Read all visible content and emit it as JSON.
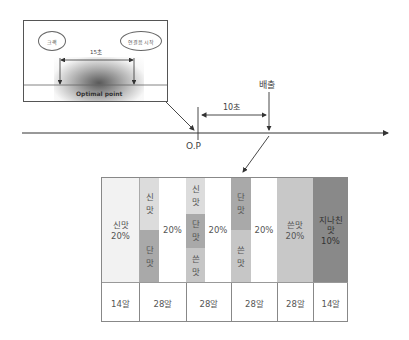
{
  "inset": {
    "left_oval": "크랙",
    "right_oval": "연결음 시작",
    "interval": "15초",
    "caption": "Optimal point"
  },
  "timeline": {
    "op_label": "O.P",
    "interval": "10초",
    "release_label": "배출"
  },
  "table": {
    "columns": [
      {
        "main": "신맛\n20%",
        "strips": [],
        "count": "14알"
      },
      {
        "main": "20%",
        "strips": [
          {
            "text": "신\n맛"
          },
          {
            "text": "단\n맛"
          }
        ],
        "count": "28알"
      },
      {
        "main": "20%",
        "strips": [
          {
            "text": "신\n맛"
          },
          {
            "text": "단\n맛"
          },
          {
            "text": "쓴\n맛"
          }
        ],
        "count": "28알"
      },
      {
        "main": "20%",
        "strips": [
          {
            "text": "단\n맛"
          },
          {
            "text": "쓴\n맛"
          }
        ],
        "count": "28알"
      },
      {
        "main": "쓴맛\n20%",
        "strips": [],
        "count": "28알"
      },
      {
        "main": "지나친\n맛\n10%",
        "strips": [],
        "count": "14알"
      }
    ]
  },
  "colors": {
    "sour": "#f2f2f2",
    "sour_strip": "#dcdcdc",
    "sweet_strip": "#a9a9a9",
    "bitter_strip": "#c6c6c6",
    "bitter": "#c8c8c8",
    "excess": "#898989"
  }
}
